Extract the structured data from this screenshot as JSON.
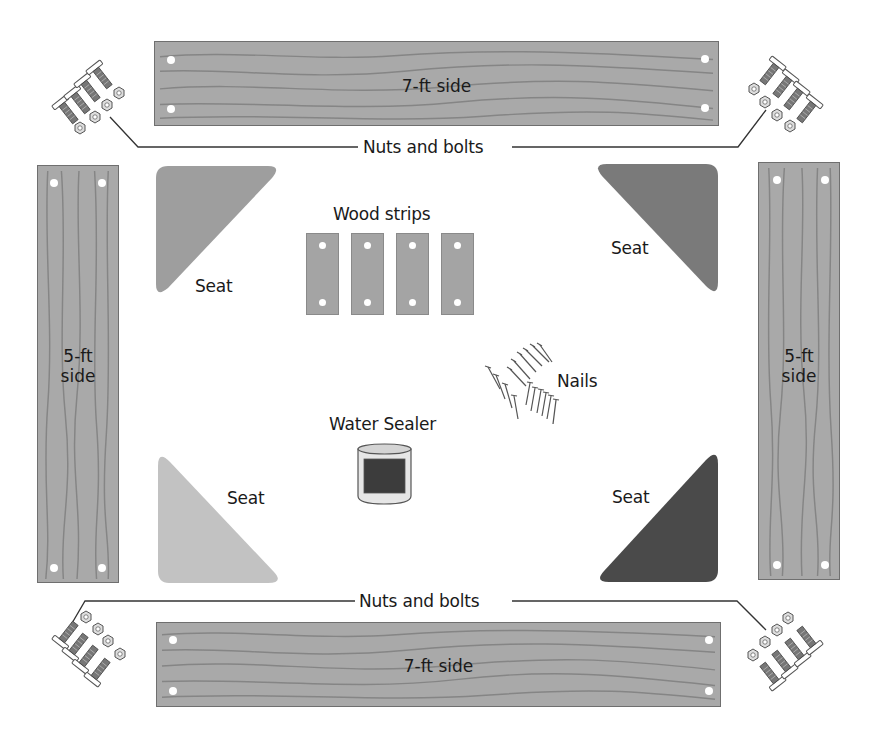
{
  "diagram": {
    "type": "parts-layout",
    "boards": {
      "top": {
        "label": "7-ft side"
      },
      "bottom": {
        "label": "7-ft side"
      },
      "left": {
        "label_line1": "5-ft",
        "label_line2": "side"
      },
      "right": {
        "label_line1": "5-ft",
        "label_line2": "side"
      }
    },
    "hardware": {
      "top_label": "Nuts and bolts",
      "bottom_label": "Nuts and bolts"
    },
    "seats": [
      {
        "position": "top-left",
        "label": "Seat",
        "color": "#9e9e9e"
      },
      {
        "position": "top-right",
        "label": "Seat",
        "color": "#7a7a7a"
      },
      {
        "position": "bottom-left",
        "label": "Seat",
        "color": "#c2c2c2"
      },
      {
        "position": "bottom-right",
        "label": "Seat",
        "color": "#4a4a4a"
      }
    ],
    "wood_strips": {
      "label": "Wood strips",
      "count": 4
    },
    "nails": {
      "label": "Nails"
    },
    "water_sealer": {
      "label": "Water Sealer"
    },
    "colors": {
      "wood": "#a9a9a9",
      "grain": "#858585",
      "outline": "#6f6f6f",
      "leader_line": "#333333"
    }
  }
}
